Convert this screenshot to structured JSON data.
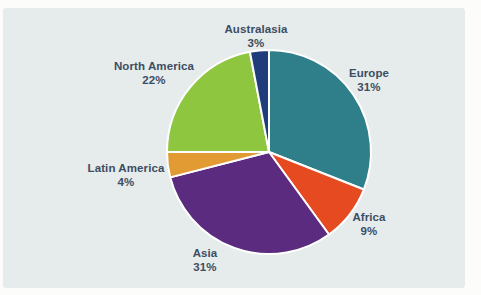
{
  "figure": {
    "kind": "pie chart figure on light panel",
    "title": "",
    "legend": "none"
  },
  "colors": {
    "page_background": "#fcfcfb",
    "panel_background": "#e6ebec",
    "label_text": "#3d4d61",
    "slice_border": "#ffffff"
  },
  "chart_data": {
    "type": "pie",
    "title": "",
    "direction": "clockwise",
    "start_angle_deg": 0,
    "label_style": "outside, region name above percent value",
    "slices": [
      {
        "id": "europe",
        "label": "Europe",
        "value": 31,
        "percent_label": "31%",
        "color": "#2f7f8a"
      },
      {
        "id": "africa",
        "label": "Africa",
        "value": 9,
        "percent_label": "9%",
        "color": "#e54a21"
      },
      {
        "id": "asia",
        "label": "Asia",
        "value": 31,
        "percent_label": "31%",
        "color": "#5a2b7e"
      },
      {
        "id": "latin-america",
        "label": "Latin America",
        "value": 4,
        "percent_label": "4%",
        "color": "#e29a33"
      },
      {
        "id": "north-america",
        "label": "North America",
        "value": 22,
        "percent_label": "22%",
        "color": "#8ec63f"
      },
      {
        "id": "australasia",
        "label": "Australasia",
        "value": 3,
        "percent_label": "3%",
        "color": "#1e3d7a"
      }
    ]
  }
}
